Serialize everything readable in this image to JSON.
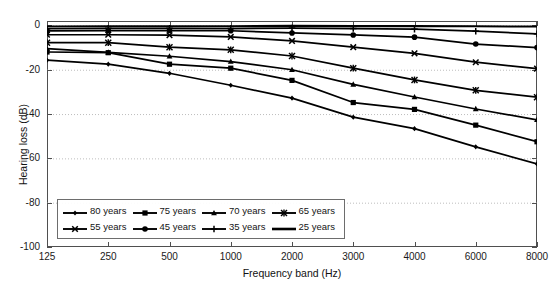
{
  "figure": {
    "cropped_title": "",
    "background_color": "#ffffff",
    "line_color": "#000000",
    "grid_color": "#bdbdbd",
    "axis_color": "#4f4f4f"
  },
  "axes": {
    "ylabel": "Hearing loss (dB)",
    "xlabel": "Frequency band (Hz)",
    "yticks": [
      "0",
      "-20",
      "-40",
      "-60",
      "-80",
      "-100"
    ],
    "xticks": [
      "125",
      "250",
      "500",
      "1000",
      "2000",
      "3000",
      "4000",
      "6000",
      "8000"
    ]
  },
  "legend": {
    "rows": [
      [
        {
          "label": "80 years",
          "marker": "diamond"
        },
        {
          "label": "75 years",
          "marker": "square"
        },
        {
          "label": "70 years",
          "marker": "triangle"
        },
        {
          "label": "65 years",
          "marker": "asterisk"
        }
      ],
      [
        {
          "label": "55 years",
          "marker": "xcross"
        },
        {
          "label": "45 years",
          "marker": "circle"
        },
        {
          "label": "35 years",
          "marker": "plus"
        },
        {
          "label": "25 years",
          "marker": "none"
        }
      ]
    ]
  },
  "chart_data": {
    "type": "line",
    "title": "",
    "xlabel": "Frequency band (Hz)",
    "ylabel": "Hearing loss (dB)",
    "categories": [
      "125",
      "250",
      "500",
      "1000",
      "2000",
      "3000",
      "4000",
      "6000",
      "8000"
    ],
    "x_scale": "categorical",
    "ylim": [
      -100,
      2
    ],
    "yticks": [
      0,
      -20,
      -40,
      -60,
      -80,
      -100
    ],
    "grid": "horizontal-dotted",
    "legend_position": "lower-left-inside",
    "series": [
      {
        "name": "25 years",
        "marker": "none",
        "values": [
          -0.5,
          -0.4,
          -0.4,
          -0.4,
          -0.2,
          -0.3,
          -0.3,
          -0.4,
          -0.5
        ]
      },
      {
        "name": "35 years",
        "marker": "plus",
        "values": [
          -1.5,
          -1.3,
          -1.3,
          -1.4,
          -1.2,
          -1.4,
          -1.7,
          -2.6,
          -3.8
        ]
      },
      {
        "name": "45 years",
        "marker": "circle",
        "values": [
          -2.5,
          -2.3,
          -2.3,
          -2.4,
          -3.4,
          -4.3,
          -5.3,
          -8.4,
          -10.0
        ]
      },
      {
        "name": "55 years",
        "marker": "xcross",
        "values": [
          -4.2,
          -4.2,
          -4.4,
          -5.2,
          -7.0,
          -9.8,
          -12.6,
          -16.6,
          -19.5
        ]
      },
      {
        "name": "65 years",
        "marker": "asterisk",
        "values": [
          -7.8,
          -7.8,
          -9.8,
          -11.0,
          -13.8,
          -19.3,
          -24.6,
          -29.3,
          -32.4
        ]
      },
      {
        "name": "70 years",
        "marker": "triangle",
        "values": [
          -10.5,
          -12.2,
          -13.9,
          -16.3,
          -20.0,
          -26.6,
          -32.3,
          -37.7,
          -42.6
        ]
      },
      {
        "name": "75 years",
        "marker": "square",
        "values": [
          -12.0,
          -12.3,
          -17.5,
          -19.3,
          -24.8,
          -34.8,
          -37.9,
          -45.0,
          -52.5
        ]
      },
      {
        "name": "80 years",
        "marker": "diamond",
        "values": [
          -15.7,
          -17.5,
          -21.6,
          -27.0,
          -32.8,
          -41.4,
          -46.6,
          -54.8,
          -62.5
        ]
      }
    ]
  }
}
